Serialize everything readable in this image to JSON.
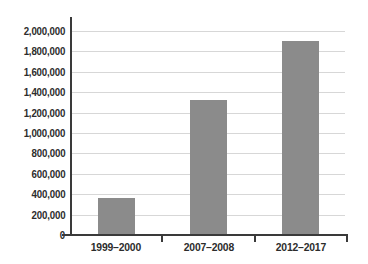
{
  "chart_data": {
    "type": "bar",
    "categories": [
      "1999–2000",
      "2007–2008",
      "2012–2017"
    ],
    "values": [
      360000,
      1320000,
      1900000
    ],
    "ylim": [
      0,
      2000000
    ],
    "ytick_step": 200000,
    "ytick_labels": [
      "0",
      "200,000",
      "400,000",
      "600,000",
      "800,000",
      "1,000,000",
      "1,200,000",
      "1,400,000",
      "1,600,000",
      "1,800,000",
      "2,000,000"
    ],
    "grid": true,
    "legend": false,
    "colors": {
      "bar": "#8b8b8b",
      "grid": "#d7d7d7",
      "axis": "#3a3a3a",
      "text": "#2c2c2c",
      "background": "#ffffff"
    }
  }
}
